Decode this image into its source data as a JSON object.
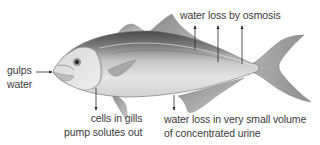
{
  "diagram": {
    "labels": {
      "gulps": {
        "line1": "gulps",
        "line2": "water"
      },
      "osmosis": {
        "line1": "water loss by osmosis"
      },
      "gills": {
        "line1": "cells in gills",
        "line2": "pump solutes out"
      },
      "urine": {
        "line1": "water loss in very small volume",
        "line2": "of concentrated urine"
      }
    },
    "arrows": [
      {
        "name": "gulps-arrow",
        "direction": "right",
        "target": "mouth"
      },
      {
        "name": "osmosis-arrow-1",
        "direction": "up"
      },
      {
        "name": "osmosis-arrow-2",
        "direction": "up"
      },
      {
        "name": "osmosis-arrow-3",
        "direction": "up"
      },
      {
        "name": "gills-arrow",
        "direction": "down"
      },
      {
        "name": "urine-arrow",
        "direction": "down"
      }
    ],
    "colors": {
      "background": "#ffffff",
      "text": "#3a3a3a",
      "arrow": "#2a2a2a",
      "fish_dark": "#5a5a5a",
      "fish_light": "#e6e6e6"
    }
  }
}
